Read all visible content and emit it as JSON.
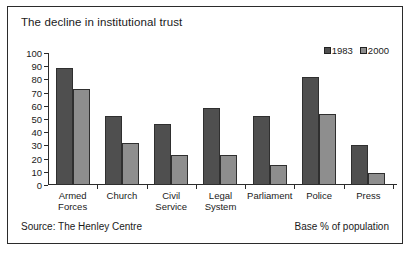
{
  "title": "The decline in institutional trust",
  "footer": {
    "source": "Source: The Henley Centre",
    "base": "Base % of population"
  },
  "chart_data": {
    "type": "bar",
    "title": "The decline in institutional trust",
    "xlabel": "",
    "ylabel": "",
    "ylim": [
      0,
      100
    ],
    "yticks": [
      0,
      10,
      20,
      30,
      40,
      50,
      60,
      70,
      80,
      90,
      100
    ],
    "grid": false,
    "legend_position": "top-right",
    "categories": [
      "Armed Forces",
      "Church",
      "Civil Service",
      "Legal System",
      "Parliament",
      "Police",
      "Press"
    ],
    "category_lines": [
      [
        "Armed",
        "Forces"
      ],
      [
        "Church"
      ],
      [
        "Civil",
        "Service"
      ],
      [
        "Legal",
        "System"
      ],
      [
        "Parliament"
      ],
      [
        "Police"
      ],
      [
        "Press"
      ]
    ],
    "series": [
      {
        "name": "1983",
        "color": "#4f4f4f",
        "values": [
          89,
          52,
          46,
          58,
          52,
          82,
          30
        ]
      },
      {
        "name": "2000",
        "color": "#8e8e8e",
        "values": [
          73,
          32,
          23,
          23,
          15,
          54,
          9
        ]
      }
    ]
  }
}
